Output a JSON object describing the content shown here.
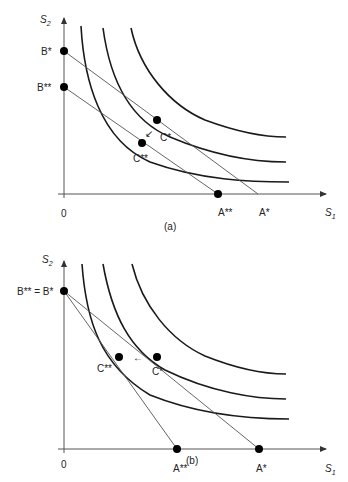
{
  "panel_a": {
    "caption": "(a)",
    "y_axis_label": "S",
    "y_axis_sub": "2",
    "x_axis_label": "S",
    "x_axis_sub": "1",
    "origin_label": "0",
    "points": {
      "B_star": "B*",
      "B_dstar": "B**",
      "C_star": "C*",
      "C_dstar": "C**",
      "A_star": "A*",
      "A_dstar": "A**"
    },
    "arrow": "↙"
  },
  "panel_b": {
    "caption": "(b)",
    "y_axis_label": "S",
    "y_axis_sub": "2",
    "x_axis_label": "S",
    "x_axis_sub": "1",
    "origin_label": "0",
    "points": {
      "B_equal": "B** = B*",
      "C_star": "C*",
      "C_dstar": "C**",
      "A_star": "A*",
      "A_dstar": "A**"
    },
    "arrow": "←"
  },
  "colors": {
    "curve": "#1a1a1a",
    "budget_line": "#555555",
    "axis": "#555555",
    "point": "#000000"
  }
}
